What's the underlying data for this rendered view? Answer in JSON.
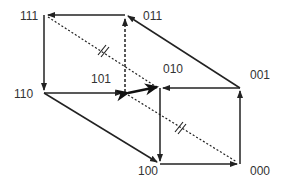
{
  "diagram": {
    "type": "cube-state-transition-graph",
    "line_color": "#222222",
    "vertices": [
      {
        "id": "111",
        "label": "111"
      },
      {
        "id": "011",
        "label": "011"
      },
      {
        "id": "110",
        "label": "110"
      },
      {
        "id": "101",
        "label": "101"
      },
      {
        "id": "010",
        "label": "010"
      },
      {
        "id": "001",
        "label": "001"
      },
      {
        "id": "100",
        "label": "100"
      },
      {
        "id": "000",
        "label": "000"
      }
    ],
    "edges": [
      {
        "from": "011",
        "to": "111",
        "style": "solid"
      },
      {
        "from": "111",
        "to": "110",
        "style": "solid"
      },
      {
        "from": "110",
        "to": "101",
        "style": "solid"
      },
      {
        "from": "101",
        "to": "011",
        "style": "dashed"
      },
      {
        "from": "001",
        "to": "011",
        "style": "solid"
      },
      {
        "from": "001",
        "to": "010",
        "style": "solid"
      },
      {
        "from": "000",
        "to": "001",
        "style": "solid"
      },
      {
        "from": "100",
        "to": "000",
        "style": "solid"
      },
      {
        "from": "110",
        "to": "100",
        "style": "solid"
      },
      {
        "from": "010",
        "to": "100",
        "style": "solid"
      },
      {
        "from": "101",
        "to": "010",
        "style": "bold-bidirectional"
      },
      {
        "from": "101",
        "to": "111",
        "style": "dotted-diagonal",
        "mark": "//"
      },
      {
        "from": "010",
        "to": "000",
        "style": "dotted-diagonal",
        "mark": "//"
      }
    ]
  }
}
